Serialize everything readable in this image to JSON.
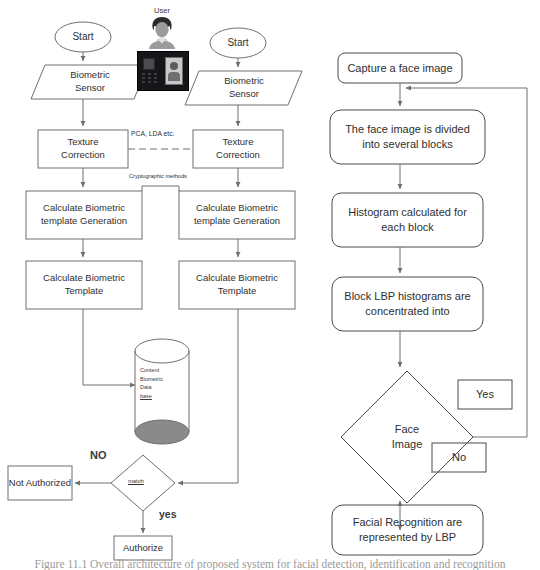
{
  "figure": {
    "caption": "Figure 11.1 Overall architecture of proposed system for facial detection, identification and recognition"
  },
  "left_diagram": {
    "title": "Biometric enrollment and verification flow",
    "user_group": {
      "label": "User",
      "avatar_icon": "user-avatar-icon",
      "device_icon": "biometric-scanner-device-icon"
    },
    "enrollment_branch": {
      "start": "Start",
      "sensor": "Biometric\nSensor",
      "texture_correction": "Texture\nCorrection",
      "template_generation": "Calculate Biometric\ntemplate Generation",
      "template": "Calculate Biometric\nTemplate"
    },
    "verification_branch": {
      "start": "Start",
      "sensor": "Biometric\nSensor",
      "texture_correction": "Texture\nCorrection",
      "template_generation": "Calculate Biometric\ntemplate Generation",
      "template": "Calculate Biometric\nTemplate"
    },
    "link_labels": {
      "pca_lda": "PCA, LDA etc.",
      "cryptographic": "Cryptographic methods"
    },
    "database": {
      "line1": "Content",
      "line2": "Biometric",
      "line3": "Data",
      "line4": "base"
    },
    "decision": {
      "label": "match",
      "no_label": "NO",
      "yes_label": "yes"
    },
    "outcomes": {
      "not_authorized": "Not Authorized",
      "authorize": "Authorize"
    }
  },
  "right_diagram": {
    "title": "LBP facial recognition flow",
    "steps": [
      {
        "id": "capture",
        "label": "Capture a face image"
      },
      {
        "id": "divide",
        "label": "The face image is divided\ninto several blocks"
      },
      {
        "id": "histogram",
        "label": "Histogram calculated for\neach block"
      },
      {
        "id": "concentrate",
        "label": "Block LBP histograms are\nconcentrated into"
      }
    ],
    "decision": {
      "label": "Face\nImage"
    },
    "branch_labels": {
      "yes": "Yes",
      "no": "No"
    },
    "result": {
      "label": "Facial Recognition are\nrepresented by LBP"
    }
  },
  "style": {
    "stroke": "#6f6f6f",
    "stroke_dark": "#4a4a4a",
    "text": "#2f2f2f",
    "background": "#ffffff",
    "db_shade": "#8a8a8a"
  }
}
